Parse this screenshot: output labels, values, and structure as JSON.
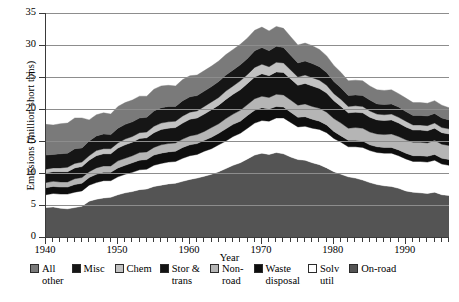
{
  "chart_data": {
    "type": "area",
    "title": "",
    "xlabel": "Year",
    "ylabel": "Emissions (million short tons)",
    "xlim": [
      1940,
      1996
    ],
    "ylim": [
      0,
      35
    ],
    "yticks": [
      0,
      5,
      10,
      15,
      20,
      25,
      30,
      35
    ],
    "xticks": [
      1940,
      1950,
      1960,
      1970,
      1980,
      1990
    ],
    "grid": "horizontal",
    "stacked": true,
    "legend_position": "bottom",
    "x": [
      1940,
      1941,
      1942,
      1943,
      1944,
      1945,
      1946,
      1947,
      1948,
      1949,
      1950,
      1951,
      1952,
      1953,
      1954,
      1955,
      1956,
      1957,
      1958,
      1959,
      1960,
      1961,
      1962,
      1963,
      1964,
      1965,
      1966,
      1967,
      1968,
      1969,
      1970,
      1971,
      1972,
      1973,
      1974,
      1975,
      1976,
      1977,
      1978,
      1979,
      1980,
      1981,
      1982,
      1983,
      1984,
      1985,
      1986,
      1987,
      1988,
      1989,
      1990,
      1991,
      1992,
      1993,
      1994,
      1995,
      1996
    ],
    "series": [
      {
        "name": "On-road",
        "color": "#545454",
        "values": [
          4.6,
          4.7,
          4.5,
          4.4,
          4.6,
          4.8,
          5.6,
          5.9,
          6.1,
          6.2,
          6.6,
          6.9,
          7.1,
          7.4,
          7.5,
          7.9,
          8.1,
          8.3,
          8.4,
          8.7,
          9.0,
          9.2,
          9.5,
          9.8,
          10.2,
          10.7,
          11.2,
          11.6,
          12.2,
          12.8,
          13.1,
          12.9,
          13.2,
          13.0,
          12.5,
          12.1,
          12.0,
          11.6,
          11.3,
          10.8,
          10.2,
          9.8,
          9.4,
          9.2,
          8.9,
          8.5,
          8.2,
          8.0,
          7.9,
          7.6,
          7.2,
          7.0,
          6.9,
          6.8,
          7.0,
          6.6,
          6.5
        ]
      },
      {
        "name": "Solv util",
        "color": "#ffffff",
        "values": [
          2.0,
          2.1,
          2.2,
          2.3,
          2.4,
          2.4,
          2.5,
          2.6,
          2.7,
          2.6,
          2.8,
          2.9,
          3.0,
          3.1,
          3.1,
          3.3,
          3.4,
          3.4,
          3.4,
          3.6,
          3.7,
          3.7,
          3.9,
          4.0,
          4.2,
          4.3,
          4.5,
          4.6,
          4.8,
          5.0,
          5.1,
          5.2,
          5.4,
          5.6,
          5.4,
          5.1,
          5.3,
          5.4,
          5.5,
          5.5,
          5.2,
          5.0,
          4.7,
          4.9,
          5.1,
          5.0,
          5.0,
          5.1,
          5.2,
          5.1,
          5.0,
          4.8,
          4.9,
          4.9,
          5.0,
          4.8,
          4.7
        ]
      },
      {
        "name": "Waste disposal",
        "color": "#0e0e0e",
        "values": [
          1.1,
          1.1,
          1.1,
          1.1,
          1.2,
          1.2,
          1.2,
          1.3,
          1.3,
          1.3,
          1.4,
          1.4,
          1.5,
          1.5,
          1.5,
          1.6,
          1.6,
          1.6,
          1.6,
          1.7,
          1.7,
          1.7,
          1.7,
          1.8,
          1.8,
          1.9,
          1.9,
          1.9,
          2.0,
          2.0,
          2.0,
          1.9,
          1.8,
          1.7,
          1.6,
          1.5,
          1.5,
          1.4,
          1.3,
          1.2,
          1.1,
          1.0,
          1.0,
          1.0,
          1.0,
          0.9,
          0.9,
          0.9,
          0.9,
          0.9,
          0.9,
          0.9,
          0.9,
          0.9,
          0.9,
          0.9,
          0.9
        ]
      },
      {
        "name": "Non-road",
        "color": "#b5b5b5",
        "values": [
          0.8,
          0.8,
          0.8,
          0.8,
          0.9,
          0.9,
          0.9,
          1.0,
          1.0,
          1.0,
          1.1,
          1.1,
          1.1,
          1.2,
          1.2,
          1.2,
          1.3,
          1.3,
          1.3,
          1.3,
          1.4,
          1.4,
          1.4,
          1.5,
          1.5,
          1.6,
          1.6,
          1.7,
          1.7,
          1.8,
          1.8,
          1.8,
          1.9,
          1.9,
          1.9,
          1.9,
          2.0,
          2.0,
          2.0,
          2.0,
          2.0,
          2.0,
          1.9,
          2.0,
          2.0,
          2.0,
          2.0,
          2.0,
          2.1,
          2.1,
          2.1,
          2.1,
          2.1,
          2.1,
          2.2,
          2.2,
          2.2
        ]
      },
      {
        "name": "Stor & trans",
        "color": "#131313",
        "values": [
          1.5,
          1.5,
          1.6,
          1.6,
          1.7,
          1.7,
          1.8,
          1.9,
          1.9,
          1.9,
          2.0,
          2.1,
          2.1,
          2.2,
          2.2,
          2.3,
          2.4,
          2.4,
          2.4,
          2.5,
          2.6,
          2.6,
          2.7,
          2.8,
          2.9,
          3.0,
          3.1,
          3.2,
          3.3,
          3.4,
          3.5,
          3.4,
          3.5,
          3.5,
          3.3,
          3.1,
          3.2,
          3.2,
          3.1,
          3.0,
          2.8,
          2.6,
          2.4,
          2.4,
          2.4,
          2.3,
          2.2,
          2.2,
          2.2,
          2.1,
          2.0,
          1.9,
          1.9,
          1.9,
          1.9,
          1.8,
          1.8
        ]
      },
      {
        "name": "Chem",
        "color": "#c2c2c2",
        "values": [
          0.6,
          0.6,
          0.6,
          0.7,
          0.7,
          0.7,
          0.7,
          0.8,
          0.8,
          0.8,
          0.8,
          0.9,
          0.9,
          0.9,
          0.9,
          1.0,
          1.0,
          1.0,
          1.0,
          1.1,
          1.1,
          1.1,
          1.2,
          1.2,
          1.2,
          1.3,
          1.3,
          1.4,
          1.4,
          1.5,
          1.5,
          1.4,
          1.5,
          1.5,
          1.4,
          1.3,
          1.3,
          1.3,
          1.3,
          1.2,
          1.1,
          1.1,
          1.0,
          1.0,
          1.0,
          1.0,
          0.9,
          0.9,
          0.9,
          0.9,
          0.9,
          0.8,
          0.8,
          0.8,
          0.8,
          0.8,
          0.8
        ]
      },
      {
        "name": "Misc",
        "color": "#161616",
        "values": [
          2.2,
          2.1,
          2.2,
          2.2,
          2.3,
          2.2,
          2.3,
          2.3,
          2.3,
          2.2,
          2.3,
          2.3,
          2.3,
          2.3,
          2.3,
          2.4,
          2.4,
          2.4,
          2.3,
          2.4,
          2.4,
          2.4,
          2.4,
          2.4,
          2.5,
          2.5,
          2.5,
          2.5,
          2.5,
          2.6,
          2.6,
          2.5,
          2.5,
          2.4,
          2.3,
          2.2,
          2.2,
          2.2,
          2.1,
          2.0,
          1.9,
          1.8,
          1.7,
          1.7,
          1.7,
          1.7,
          1.6,
          1.6,
          1.6,
          1.6,
          1.5,
          1.5,
          1.5,
          1.5,
          1.5,
          1.5,
          1.4
        ]
      },
      {
        "name": "All other",
        "color": "#7a7a7a",
        "values": [
          4.8,
          4.6,
          4.7,
          4.7,
          4.8,
          4.7,
          3.3,
          3.3,
          3.3,
          3.2,
          3.4,
          3.4,
          3.4,
          3.4,
          3.3,
          3.4,
          3.4,
          3.3,
          3.2,
          3.3,
          3.3,
          3.2,
          3.2,
          3.2,
          3.2,
          3.2,
          3.2,
          3.2,
          3.2,
          3.2,
          3.2,
          3.1,
          3.1,
          3.0,
          2.9,
          2.8,
          2.8,
          2.8,
          2.7,
          2.6,
          2.5,
          2.4,
          2.3,
          2.3,
          2.3,
          2.2,
          2.2,
          2.2,
          2.2,
          2.1,
          2.1,
          2.0,
          2.0,
          2.0,
          2.0,
          2.0,
          1.9
        ]
      }
    ],
    "legend": [
      {
        "label": "All\nother",
        "color": "#7a7a7a"
      },
      {
        "label": "Misc",
        "color": "#161616"
      },
      {
        "label": "Chem",
        "color": "#c2c2c2"
      },
      {
        "label": "Stor &\ntrans",
        "color": "#131313"
      },
      {
        "label": "Non-\nroad",
        "color": "#b5b5b5"
      },
      {
        "label": "Waste\ndisposal",
        "color": "#0e0e0e"
      },
      {
        "label": "Solv\nutil",
        "color": "#ffffff"
      },
      {
        "label": "On-road",
        "color": "#545454"
      }
    ]
  }
}
